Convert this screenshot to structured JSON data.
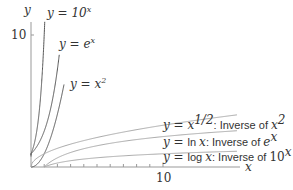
{
  "chart_data": {
    "type": "line",
    "title": "",
    "xlabel": "x",
    "ylabel": "y",
    "xlim": [
      0,
      16
    ],
    "ylim": [
      0,
      11
    ],
    "x_ticks": [
      1,
      2,
      3,
      4,
      5,
      6,
      7,
      8,
      9,
      10
    ],
    "x_tick_labels": {
      "10": "10"
    },
    "y_tick_labels": {
      "10": "10"
    },
    "grid": false,
    "series": [
      {
        "name": "y = 10^x",
        "label": "y = 10",
        "sup": "x",
        "color": "#555555"
      },
      {
        "name": "y = e^x",
        "label": "y = e",
        "sup": "x",
        "color": "#555555"
      },
      {
        "name": "y = x^2",
        "label": "y = x",
        "sup": "2",
        "color": "#555555"
      },
      {
        "name": "y = x^(1/2): Inverse of x^2",
        "label": "y = x",
        "sup": "1/2",
        "suffix": ": Inverse of ",
        "suffix_math": "x",
        "suffix_sup": "2",
        "color": "#aaaaaa"
      },
      {
        "name": "y = ln x: Inverse of e^x",
        "label": "y = ln x",
        "suffix": ": Inverse of ",
        "suffix_math": "e",
        "suffix_sup": "x",
        "color": "#aaaaaa"
      },
      {
        "name": "y = log x: Inverse of 10^x",
        "label": "y = log x",
        "suffix": ": Inverse of ",
        "suffix_math": "10",
        "suffix_sup": "x",
        "color": "#aaaaaa"
      }
    ]
  },
  "axes": {
    "x_label": "x",
    "y_label": "y",
    "x_tick_10": "10",
    "y_tick_10": "10"
  },
  "labels": {
    "exp10": {
      "pre": "y = 10",
      "sup": "x"
    },
    "expe": {
      "pre": "y = e",
      "sup": "x"
    },
    "sq": {
      "pre": "y = x",
      "sup": "2"
    },
    "sqrt": {
      "pre": "y = x",
      "sup": "1/2",
      "mid": ": Inverse of ",
      "m": "x",
      "msup": "2"
    },
    "ln": {
      "pre": "y = ",
      "fn": "ln ",
      "var": "x",
      "mid": ": Inverse of ",
      "m": "e",
      "msup": "x"
    },
    "log": {
      "pre": "y = ",
      "fn": "log ",
      "var": "x",
      "mid": ": Inverse of ",
      "m": "10",
      "msup": "x"
    }
  }
}
